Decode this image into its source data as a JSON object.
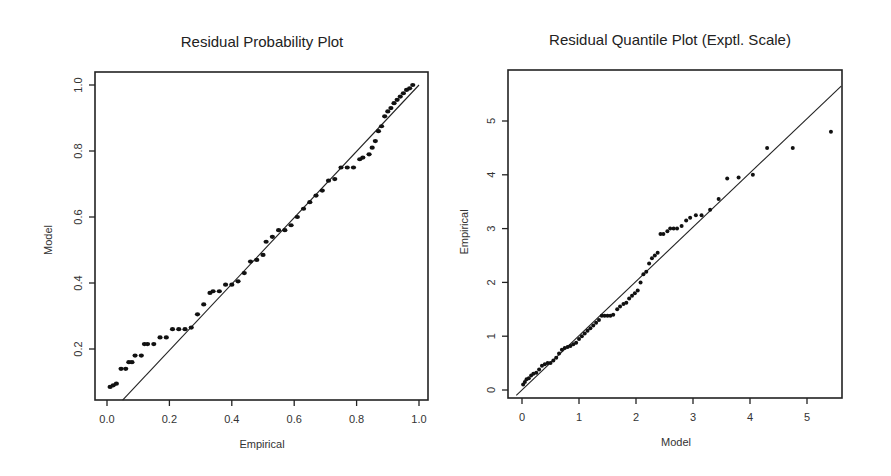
{
  "chart_data": [
    {
      "type": "scatter",
      "title": "Residual Probability Plot",
      "xlabel": "Empirical",
      "ylabel": "Model",
      "xlim": [
        0.0,
        1.0
      ],
      "ylim": [
        0.045,
        1.04
      ],
      "xticks": [
        "0.0",
        "0.2",
        "0.4",
        "0.6",
        "0.8",
        "1.0"
      ],
      "yticks": [
        "0.2",
        "0.4",
        "0.6",
        "0.8",
        "1.0"
      ],
      "grid": false,
      "reference_line": {
        "from": [
          0.05,
          0.045
        ],
        "to": [
          1.0,
          1.0
        ]
      },
      "series": [
        {
          "name": "points",
          "x": [
            0.01,
            0.02,
            0.03,
            0.045,
            0.06,
            0.07,
            0.08,
            0.09,
            0.11,
            0.12,
            0.13,
            0.15,
            0.17,
            0.19,
            0.21,
            0.23,
            0.25,
            0.27,
            0.29,
            0.31,
            0.33,
            0.34,
            0.36,
            0.38,
            0.4,
            0.42,
            0.44,
            0.46,
            0.48,
            0.5,
            0.51,
            0.53,
            0.55,
            0.57,
            0.59,
            0.61,
            0.63,
            0.65,
            0.67,
            0.69,
            0.71,
            0.73,
            0.75,
            0.77,
            0.79,
            0.81,
            0.82,
            0.84,
            0.85,
            0.86,
            0.87,
            0.88,
            0.89,
            0.9,
            0.91,
            0.92,
            0.93,
            0.94,
            0.95,
            0.96,
            0.97,
            0.98
          ],
          "y": [
            0.085,
            0.09,
            0.095,
            0.14,
            0.14,
            0.16,
            0.16,
            0.18,
            0.18,
            0.215,
            0.215,
            0.215,
            0.235,
            0.235,
            0.26,
            0.26,
            0.26,
            0.265,
            0.305,
            0.335,
            0.37,
            0.375,
            0.375,
            0.395,
            0.395,
            0.405,
            0.43,
            0.465,
            0.47,
            0.485,
            0.525,
            0.54,
            0.56,
            0.56,
            0.575,
            0.6,
            0.625,
            0.645,
            0.665,
            0.68,
            0.71,
            0.715,
            0.75,
            0.75,
            0.75,
            0.775,
            0.78,
            0.79,
            0.81,
            0.83,
            0.86,
            0.875,
            0.905,
            0.92,
            0.93,
            0.945,
            0.955,
            0.965,
            0.975,
            0.985,
            0.99,
            1.0
          ]
        }
      ]
    },
    {
      "type": "scatter",
      "title": "Residual Quantile Plot (Exptl. Scale)",
      "xlabel": "Model",
      "ylabel": "Empirical",
      "xlim": [
        -0.25,
        5.6
      ],
      "ylim": [
        -0.15,
        5.9
      ],
      "xticks": [
        "0",
        "1",
        "2",
        "3",
        "4",
        "5"
      ],
      "yticks": [
        "0",
        "1",
        "2",
        "3",
        "4",
        "5"
      ],
      "grid": false,
      "reference_line": {
        "from": [
          -0.1,
          -0.1
        ],
        "to": [
          5.6,
          5.65
        ]
      },
      "series": [
        {
          "name": "points",
          "x": [
            0.02,
            0.05,
            0.08,
            0.12,
            0.16,
            0.2,
            0.25,
            0.3,
            0.35,
            0.4,
            0.45,
            0.5,
            0.55,
            0.6,
            0.65,
            0.7,
            0.75,
            0.8,
            0.85,
            0.9,
            0.95,
            1.0,
            1.05,
            1.1,
            1.15,
            1.2,
            1.25,
            1.3,
            1.35,
            1.4,
            1.45,
            1.5,
            1.55,
            1.6,
            1.67,
            1.72,
            1.78,
            1.83,
            1.88,
            1.93,
            1.98,
            2.03,
            2.08,
            2.13,
            2.18,
            2.23,
            2.28,
            2.33,
            2.38,
            2.43,
            2.48,
            2.55,
            2.6,
            2.66,
            2.72,
            2.8,
            2.88,
            2.95,
            3.05,
            3.15,
            3.3,
            3.45,
            3.6,
            3.8,
            4.05,
            4.3,
            4.75,
            5.42
          ],
          "y": [
            0.1,
            0.15,
            0.2,
            0.22,
            0.27,
            0.3,
            0.32,
            0.38,
            0.45,
            0.48,
            0.5,
            0.5,
            0.55,
            0.6,
            0.68,
            0.75,
            0.78,
            0.8,
            0.82,
            0.85,
            0.88,
            0.95,
            1.0,
            1.05,
            1.1,
            1.15,
            1.2,
            1.25,
            1.3,
            1.38,
            1.38,
            1.38,
            1.38,
            1.4,
            1.5,
            1.55,
            1.6,
            1.62,
            1.7,
            1.75,
            1.8,
            1.85,
            2.0,
            2.15,
            2.2,
            2.35,
            2.45,
            2.5,
            2.55,
            2.9,
            2.9,
            2.95,
            3.0,
            3.0,
            3.0,
            3.05,
            3.15,
            3.2,
            3.25,
            3.25,
            3.35,
            3.55,
            3.93,
            3.95,
            4.0,
            4.5,
            4.5,
            4.8,
            4.83,
            5.75
          ]
        }
      ]
    }
  ]
}
